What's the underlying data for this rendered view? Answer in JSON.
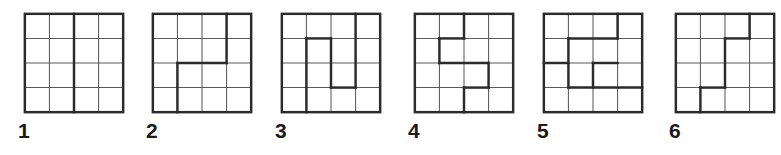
{
  "figure": {
    "type": "grid-puzzle-set",
    "grid_size": 4,
    "cell_count": 16,
    "thin_line_color": "#5a5a5a",
    "thick_line_color": "#2b2b2b",
    "background_color": "#ffffff",
    "thin_line_width": 1.1,
    "thick_line_width": 2.6
  },
  "panels": [
    {
      "label": "1",
      "name": "panel-1",
      "left": 2,
      "description": "4x4 grid divided into two 2x4 rectangles by a vertical line at column 2",
      "thick_segments": [
        [
          2,
          0,
          2,
          4
        ]
      ]
    },
    {
      "label": "2",
      "name": "panel-2",
      "left": 130,
      "description": "4x4 grid with an L-shaped division: down at column 3, across at row 2, down at column 1",
      "thick_segments": [
        [
          3,
          0,
          3,
          2
        ],
        [
          1,
          2,
          3,
          2
        ],
        [
          1,
          2,
          1,
          4
        ]
      ]
    },
    {
      "label": "3",
      "name": "panel-3",
      "left": 259,
      "description": "4x4 grid with a zigzag division forming a tall notch in the middle",
      "thick_segments": [
        [
          3,
          0,
          3,
          3
        ],
        [
          2,
          3,
          3,
          3
        ],
        [
          2,
          1,
          2,
          3
        ],
        [
          1,
          1,
          2,
          1
        ],
        [
          1,
          1,
          1,
          4
        ]
      ]
    },
    {
      "label": "4",
      "name": "panel-4",
      "left": 392,
      "description": "4x4 grid with a descending staircase division from top edge to bottom edge",
      "thick_segments": [
        [
          2,
          0,
          2,
          1
        ],
        [
          1,
          1,
          2,
          1
        ],
        [
          1,
          1,
          1,
          2
        ],
        [
          1,
          2,
          3,
          2
        ],
        [
          3,
          2,
          3,
          3
        ],
        [
          2,
          3,
          3,
          3
        ],
        [
          2,
          3,
          2,
          4
        ]
      ]
    },
    {
      "label": "5",
      "name": "panel-5",
      "left": 521,
      "description": "4x4 grid with interlocking division: notch at top right, bar on left at row 2 and a step down at column 2",
      "thick_segments": [
        [
          3,
          0,
          3,
          1
        ],
        [
          1,
          1,
          3,
          1
        ],
        [
          1,
          1,
          1,
          3
        ],
        [
          0,
          2,
          1,
          2
        ],
        [
          2,
          2,
          3,
          2
        ],
        [
          2,
          2,
          2,
          3
        ],
        [
          1,
          3,
          4,
          3
        ]
      ]
    },
    {
      "label": "6",
      "name": "panel-6",
      "left": 653,
      "description": "4x4 grid with a stepped division descending right to left from top edge to bottom edge",
      "thick_segments": [
        [
          3,
          0,
          3,
          1
        ],
        [
          2,
          1,
          3,
          1
        ],
        [
          2,
          1,
          2,
          3
        ],
        [
          1,
          3,
          2,
          3
        ],
        [
          1,
          3,
          1,
          4
        ]
      ]
    }
  ]
}
